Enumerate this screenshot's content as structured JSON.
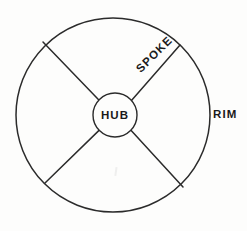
{
  "diagram": {
    "name": "wheel-hub-spoke-rim-diagram",
    "background_color": "#fdfdfc",
    "line_color": "#2b2b2b",
    "text_color": "#1a1a1a",
    "labels": {
      "hub": "HUB",
      "spoke": "SPOKE",
      "rim": "RIM"
    },
    "geometry": {
      "rim_center_x": 113,
      "rim_center_y": 115,
      "rim_radius": 97,
      "hub_center_x": 115,
      "hub_center_y": 115,
      "hub_radius": 22,
      "spoke_count": 4,
      "spoke_angles_deg": [
        45,
        135,
        225,
        315
      ],
      "spoke_endpoints": [
        {
          "x": 180,
          "y": 45
        },
        {
          "x": 43,
          "y": 42
        },
        {
          "x": 45,
          "y": 183
        },
        {
          "x": 183,
          "y": 187
        }
      ]
    },
    "spoke_label_rotation_deg": -45
  }
}
